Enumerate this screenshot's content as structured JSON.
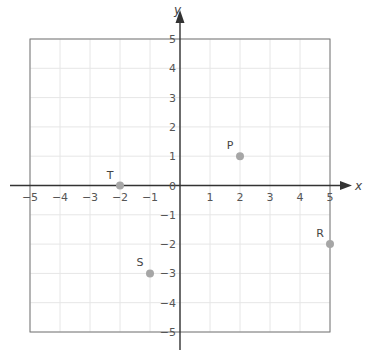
{
  "chart_data": {
    "type": "scatter",
    "title": "",
    "xlabel": "x",
    "ylabel": "y",
    "xlim": [
      -5,
      5
    ],
    "ylim": [
      -5,
      5
    ],
    "grid": true,
    "x_ticks": [
      "-5",
      "-4",
      "-3",
      "-2",
      "-1",
      "1",
      "2",
      "3",
      "4",
      "5"
    ],
    "y_ticks": [
      "5",
      "4",
      "3",
      "2",
      "1",
      "0",
      "-1",
      "-2",
      "-3",
      "-4",
      "-5"
    ],
    "origin_label": "0",
    "points": [
      {
        "label": "P",
        "x": 2,
        "y": 1
      },
      {
        "label": "R",
        "x": 5,
        "y": -2
      },
      {
        "label": "S",
        "x": -1,
        "y": -3
      },
      {
        "label": "T",
        "x": -2,
        "y": 0
      }
    ]
  },
  "colors": {
    "axis": "#333333",
    "grid": "#e6e6e6",
    "border": "#777777",
    "point": "#a6a6a6"
  }
}
